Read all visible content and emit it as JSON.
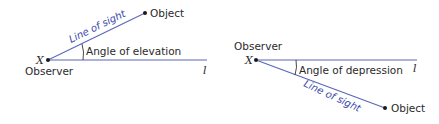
{
  "diagrams": {
    "elevation": {
      "observer_point_label": "X",
      "observer_label": "Observer",
      "object_label": "Object",
      "line_of_sight_label": "Line of sight",
      "angle_label": "Angle of elevation",
      "horizontal_line_label": "l"
    },
    "depression": {
      "observer_point_label": "X",
      "observer_label": "Observer",
      "object_label": "Object",
      "line_of_sight_label": "Line of sight",
      "angle_label": "Angle of depression",
      "horizontal_line_label": "l"
    }
  },
  "colors": {
    "line": "#5a68b8",
    "line_of_sight_text": "#3a48a8",
    "text": "#2a2a2a",
    "point": "#1a1a1a"
  }
}
